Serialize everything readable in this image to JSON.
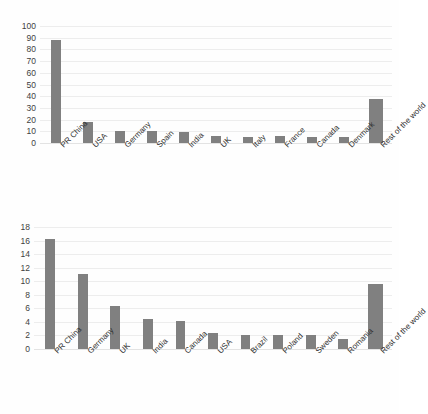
{
  "page": {
    "background_color": "#fefefe",
    "bar_color": "#808080",
    "gridline_color": "#ededed",
    "text_color": "#2f2f2f"
  },
  "chart_data": [
    {
      "id": "top",
      "type": "bar",
      "title": "",
      "subtitle": "",
      "xlabel": "",
      "ylabel": "",
      "ylim": [
        0,
        100
      ],
      "ytick_step": 10,
      "grid": true,
      "legend": "none",
      "orientation": "vertical",
      "xtick_rotation": -45,
      "categories": [
        "PR China",
        "USA",
        "Germany",
        "Spain",
        "India",
        "UK",
        "Italy",
        "France",
        "Canada",
        "Denmark",
        "Rest of the world"
      ],
      "values": [
        88,
        18,
        10,
        10,
        9.5,
        6,
        5,
        6,
        5.5,
        5,
        38
      ],
      "ytick_labels": [
        "0",
        "10",
        "20",
        "30",
        "40",
        "50",
        "60",
        "70",
        "80",
        "90",
        "100"
      ]
    },
    {
      "id": "bottom",
      "type": "bar",
      "title": "",
      "subtitle": "",
      "xlabel": "",
      "ylabel": "",
      "ylim": [
        0,
        18
      ],
      "ytick_step": 2,
      "grid": true,
      "legend": "none",
      "orientation": "vertical",
      "xtick_rotation": -45,
      "categories": [
        "PR China",
        "Germany",
        "UK",
        "India",
        "Canada",
        "USA",
        "Brazil",
        "Poland",
        "Sweden",
        "Romania",
        "Rest of the world"
      ],
      "values": [
        16.3,
        11.1,
        6.4,
        4.5,
        4.2,
        2.3,
        2.0,
        2.0,
        2.0,
        1.5,
        9.6
      ],
      "ytick_labels": [
        "0",
        "2",
        "4",
        "6",
        "8",
        "10",
        "12",
        "14",
        "16",
        "18"
      ]
    }
  ]
}
